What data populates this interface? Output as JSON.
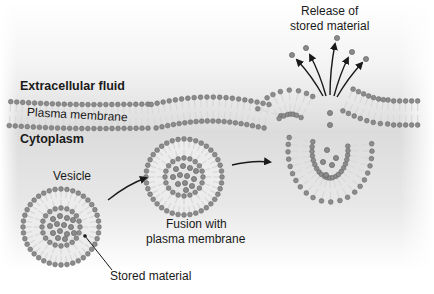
{
  "figure": {
    "topic": "Exocytosis",
    "colors": {
      "head": "#8c8c8c",
      "head_stroke": "#5e5e5e",
      "tail": "#d9d9d9",
      "lumen": "#e4e4e4",
      "cargo": "#8a8a8a",
      "arrow": "#1a1a1a",
      "bg_mid": "#dedede",
      "text": "#1a1a1a"
    }
  },
  "labels": {
    "extracellular": "Extracellular fluid",
    "plasma_membrane": "Plasma membrane",
    "cytoplasm": "Cytoplasm",
    "vesicle": "Vesicle",
    "stored_material": "Stored material",
    "fusion_line1": "Fusion with",
    "fusion_line2": "plasma membrane",
    "release_line1": "Release of",
    "release_line2": "stored material"
  },
  "stages": [
    {
      "name": "vesicle",
      "cargo_particles": 14
    },
    {
      "name": "fusion",
      "cargo_particles": 12
    },
    {
      "name": "release",
      "internal_particles": 7,
      "released_particles": 5
    }
  ]
}
